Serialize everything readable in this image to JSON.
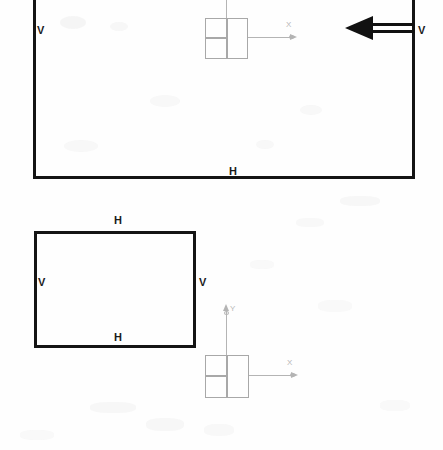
{
  "drawing": {
    "title": "Rectangular wall outlines with flow direction arrow",
    "background_color": "#fefefe",
    "line_color": "#141414",
    "ucs_color": "#a8a8a8"
  },
  "shapes": {
    "upper_rectangle": {
      "name": "upper-wall-rectangle",
      "labels": {
        "left_edge": "V",
        "right_edge": "V",
        "bottom_edge": "H"
      }
    },
    "lower_rectangle": {
      "name": "lower-wall-rectangle",
      "labels": {
        "top_edge": "H",
        "left_edge": "V",
        "right_edge": "V",
        "bottom_edge": "H"
      }
    }
  },
  "arrow": {
    "name": "flow-direction-arrow",
    "direction": "left",
    "style": "double-line-shaft-solid-head"
  },
  "ucs_upper": {
    "name": "coordinate-system-symbol-upper",
    "x_axis_label": "X",
    "y_axis_label": "Y"
  },
  "ucs_lower": {
    "name": "coordinate-system-symbol-lower",
    "x_axis_label": "X",
    "y_axis_label": "Y"
  }
}
